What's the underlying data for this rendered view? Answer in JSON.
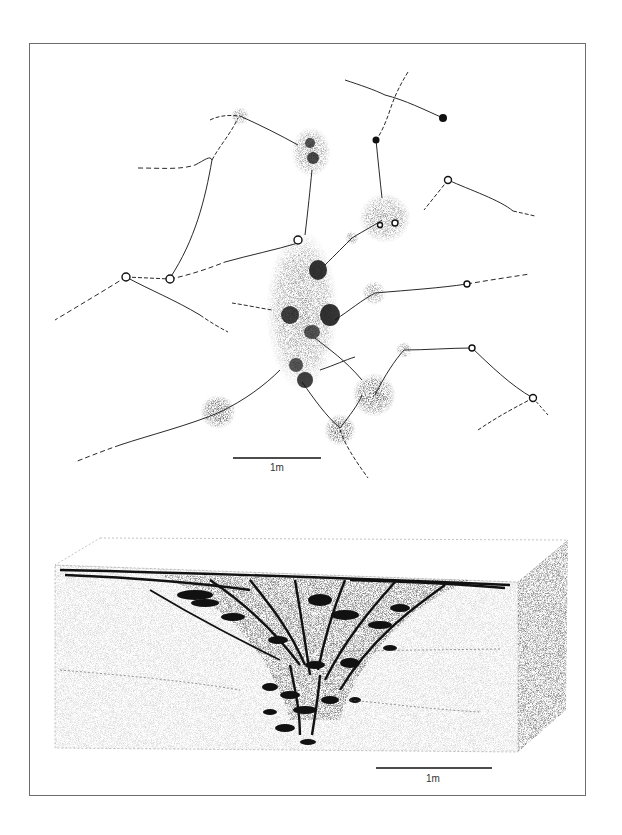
{
  "figure": {
    "panels": [
      {
        "id": "plan-view",
        "description": "Plan view of nest chambers connected by tunnels",
        "scale_bar": {
          "label": "1m"
        }
      },
      {
        "id": "block-diagram",
        "description": "Cut-away block diagram showing branching galleries and chambers below ground",
        "scale_bar": {
          "label": "1m"
        }
      }
    ]
  },
  "colors": {
    "ink": "#111111",
    "stipple": "#333333",
    "frame": "#6d6d6d",
    "background": "#ffffff"
  }
}
